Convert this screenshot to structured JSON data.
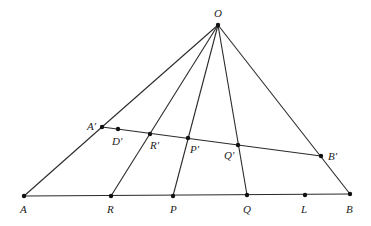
{
  "diagram": {
    "title": "",
    "points": [
      {
        "id": "O",
        "label": "O",
        "x": 218,
        "y": 25,
        "lx": 214,
        "ly": 17
      },
      {
        "id": "A1",
        "label": "A′",
        "x": 102,
        "y": 127,
        "lx": 87,
        "ly": 130
      },
      {
        "id": "D1",
        "label": "D′",
        "x": 118,
        "y": 129,
        "lx": 112,
        "ly": 145
      },
      {
        "id": "R1",
        "label": "R′",
        "x": 150,
        "y": 134,
        "lx": 150,
        "ly": 149
      },
      {
        "id": "P1",
        "label": "P′",
        "x": 188,
        "y": 138,
        "lx": 190,
        "ly": 153
      },
      {
        "id": "Q1",
        "label": "Q′",
        "x": 238,
        "y": 145,
        "lx": 224,
        "ly": 159
      },
      {
        "id": "B1",
        "label": "B′",
        "x": 321,
        "y": 156,
        "lx": 328,
        "ly": 160
      },
      {
        "id": "A",
        "label": "A",
        "x": 24,
        "y": 196,
        "lx": 20,
        "ly": 213
      },
      {
        "id": "R",
        "label": "R",
        "x": 111,
        "y": 196,
        "lx": 107,
        "ly": 213
      },
      {
        "id": "P",
        "label": "P",
        "x": 173,
        "y": 196,
        "lx": 170,
        "ly": 213
      },
      {
        "id": "Q",
        "label": "Q",
        "x": 247,
        "y": 195,
        "lx": 243,
        "ly": 213
      },
      {
        "id": "L",
        "label": "L",
        "x": 305,
        "y": 195,
        "lx": 301,
        "ly": 213
      },
      {
        "id": "B",
        "label": "B",
        "x": 350,
        "y": 194,
        "lx": 346,
        "ly": 213
      }
    ],
    "segments": [
      [
        "O",
        "A1"
      ],
      [
        "A1",
        "A"
      ],
      [
        "O",
        "R"
      ],
      [
        "O",
        "P"
      ],
      [
        "O",
        "Q"
      ],
      [
        "O",
        "B"
      ],
      [
        "A1",
        "B1"
      ],
      [
        "A",
        "B"
      ]
    ]
  }
}
